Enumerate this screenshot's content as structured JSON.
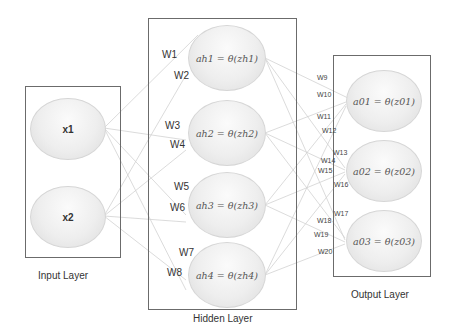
{
  "input_layer": {
    "label": "Input Layer",
    "nodes": [
      "x1",
      "x2"
    ]
  },
  "hidden_layer": {
    "label": "Hidden Layer",
    "nodes": [
      "ah1 =  θ(zh1)",
      "ah2 =  θ(zh2)",
      "ah3 =  θ(zh3)",
      "ah4 =  θ(zh4)"
    ]
  },
  "output_layer": {
    "label": "Output Layer",
    "nodes": [
      "a01 = θ(z01)",
      "a02 = θ(z02)",
      "a03 = θ(z03)"
    ]
  },
  "weights": {
    "input_to_hidden": [
      "W1",
      "W2",
      "W3",
      "W4",
      "W5",
      "W6",
      "W7",
      "W8"
    ],
    "hidden_to_output": [
      "W9",
      "W10",
      "W11",
      "W12",
      "W13",
      "W14",
      "W15",
      "W16",
      "W17",
      "W18",
      "W19",
      "W20"
    ]
  },
  "colors": {
    "box_border": "#6b6b6b",
    "link": "#d0d0d0",
    "node_fill": "#eeeeee"
  }
}
